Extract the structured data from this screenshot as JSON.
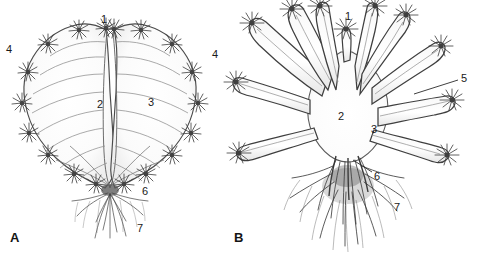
{
  "figure": {
    "type": "scientific-line-drawing",
    "background_color": "#ffffff",
    "ink_color": "#2b2b2b",
    "panels": [
      {
        "id": "A",
        "letter": "A",
        "letter_pos": {
          "x": 10,
          "y": 231
        },
        "description": "Rosette-form thallus with closely packed marginal segments forming a heart-shaped outline, each marginal node bearing a stellate spine cluster; basal holdfast with fibrous rhizoids",
        "callouts": [
          {
            "number": "1",
            "x": 101,
            "y": 14,
            "leader": false
          },
          {
            "number": "4",
            "x": 6,
            "y": 44,
            "leader": false
          },
          {
            "number": "2",
            "x": 97,
            "y": 99,
            "leader": false
          },
          {
            "number": "3",
            "x": 148,
            "y": 97,
            "leader": false
          },
          {
            "number": "6",
            "x": 142,
            "y": 186,
            "leader": false
          },
          {
            "number": "7",
            "x": 137,
            "y": 223,
            "leader": false
          }
        ]
      },
      {
        "id": "B",
        "letter": "B",
        "letter_pos": {
          "x": 234,
          "y": 231
        },
        "description": "Stellate form with long free radiating lobes, each lobe tipped by a stellate spine cluster; dense fibrous root mass at the base",
        "callouts": [
          {
            "number": "1",
            "x": 345,
            "y": 11,
            "leader": false
          },
          {
            "number": "4",
            "x": 212,
            "y": 49,
            "leader": false
          },
          {
            "number": "5",
            "x": 461,
            "y": 73,
            "leader": true,
            "leader_line": {
              "x1": 458,
              "y1": 80,
              "x2": 414,
              "y2": 94
            }
          },
          {
            "number": "2",
            "x": 338,
            "y": 111,
            "leader": false
          },
          {
            "number": "3",
            "x": 371,
            "y": 124,
            "leader": false
          },
          {
            "number": "6",
            "x": 374,
            "y": 171,
            "leader": true,
            "leader_line": {
              "x1": 372,
              "y1": 172,
              "x2": 353,
              "y2": 160
            }
          },
          {
            "number": "7",
            "x": 394,
            "y": 202,
            "leader": false
          }
        ]
      }
    ],
    "legend_numbers": [
      "1",
      "2",
      "3",
      "4",
      "5",
      "6",
      "7"
    ]
  }
}
